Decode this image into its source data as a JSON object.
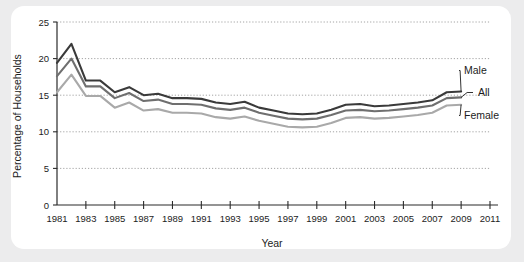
{
  "chart_data": {
    "type": "line",
    "title": "",
    "xlabel": "Year",
    "ylabel": "Percentage of Households",
    "xlim": [
      1981,
      2011
    ],
    "ylim": [
      0,
      25
    ],
    "grid": true,
    "legend_position": "inline-right-annotations",
    "x": [
      1981,
      1982,
      1983,
      1984,
      1985,
      1986,
      1987,
      1988,
      1989,
      1990,
      1991,
      1992,
      1993,
      1994,
      1995,
      1996,
      1997,
      1998,
      1999,
      2000,
      2001,
      2002,
      2003,
      2004,
      2005,
      2006,
      2007,
      2008,
      2009
    ],
    "xticks": [
      1981,
      1983,
      1985,
      1987,
      1989,
      1991,
      1993,
      1995,
      1997,
      1999,
      2001,
      2003,
      2005,
      2007,
      2009,
      2011
    ],
    "yticks": [
      0,
      5,
      10,
      15,
      20,
      25
    ],
    "series": [
      {
        "name": "Male",
        "color": "#3a3a3a",
        "values": [
          19.4,
          22.0,
          17.0,
          17.0,
          15.4,
          16.1,
          15.0,
          15.2,
          14.6,
          14.6,
          14.5,
          14.0,
          13.8,
          14.1,
          13.3,
          12.9,
          12.5,
          12.4,
          12.5,
          13.0,
          13.7,
          13.8,
          13.5,
          13.6,
          13.8,
          14.0,
          14.3,
          15.4,
          15.5
        ]
      },
      {
        "name": "All",
        "color": "#6f6f6f",
        "values": [
          17.6,
          20.0,
          16.2,
          16.2,
          14.6,
          15.3,
          14.2,
          14.4,
          13.8,
          13.8,
          13.7,
          13.2,
          13.0,
          13.3,
          12.6,
          12.2,
          11.8,
          11.7,
          11.8,
          12.3,
          12.9,
          13.0,
          12.8,
          12.9,
          13.1,
          13.3,
          13.6,
          14.6,
          14.7
        ]
      },
      {
        "name": "Female",
        "color": "#a9a9a9",
        "values": [
          15.4,
          17.8,
          14.9,
          14.9,
          13.3,
          14.0,
          12.9,
          13.1,
          12.6,
          12.6,
          12.5,
          12.0,
          11.8,
          12.1,
          11.5,
          11.1,
          10.7,
          10.6,
          10.7,
          11.2,
          11.9,
          12.0,
          11.8,
          11.9,
          12.1,
          12.3,
          12.6,
          13.6,
          13.7
        ]
      }
    ],
    "annotations": [
      {
        "label": "Male",
        "series": "Male"
      },
      {
        "label": "All",
        "series": "All"
      },
      {
        "label": "Female",
        "series": "Female"
      }
    ]
  }
}
